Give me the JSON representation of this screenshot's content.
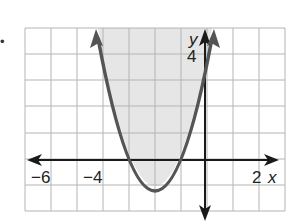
{
  "bullet": "•",
  "graph": {
    "x_labels": [
      {
        "text": "−6",
        "value": -6
      },
      {
        "text": "−4",
        "value": -4
      },
      {
        "text": "2",
        "value": 2
      }
    ],
    "x_axis_label": "x",
    "y_axis_label": "y",
    "y_labels": [
      {
        "text": "4",
        "value": 4
      }
    ],
    "grid": {
      "x_range": [
        -7,
        3
      ],
      "y_range": [
        -2,
        5
      ],
      "unit": 1
    },
    "curve": {
      "equation": "y = (x + 2)^2 - 1",
      "vertex": [
        -2,
        -1
      ],
      "x_intercepts": [
        -3,
        -1
      ],
      "style": "solid",
      "shading": "inside (above)"
    },
    "colors": {
      "curve": "#555555",
      "shade": "#e6e6e6",
      "grid": "#b4b4b4",
      "axis": "#1a1a1a"
    }
  }
}
